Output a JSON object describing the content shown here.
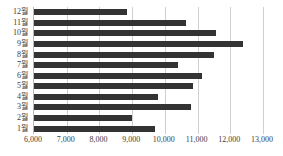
{
  "chart_data": {
    "type": "bar",
    "orientation": "horizontal",
    "title": "",
    "subtitle": "",
    "xlabel": "",
    "ylabel": "",
    "categories": [
      "1월",
      "2월",
      "3월",
      "4월",
      "5월",
      "6월",
      "7월",
      "8월",
      "9월",
      "10월",
      "11월",
      "12월"
    ],
    "values": [
      9700,
      9000,
      10800,
      9800,
      10850,
      11150,
      10400,
      11500,
      12400,
      11550,
      10650,
      8850
    ],
    "xlim": [
      6000,
      13000
    ],
    "xticks": [
      6000,
      7000,
      8000,
      9000,
      10000,
      11000,
      12000,
      13000
    ],
    "xtick_labels": [
      "6,000",
      "7,000",
      "8,000",
      "9,000",
      "10,000",
      "11,000",
      "12,000",
      "13,000"
    ],
    "grid": "vertical",
    "legend": "none",
    "bar_color": "#333333",
    "gridline_color": "#cfcfcf",
    "axis_color": "#b8b8b8",
    "background_color": "#ffffff",
    "display_order": "top-to-bottom-descending-month",
    "rows_top_to_bottom": [
      {
        "label": "12월",
        "value": 8850
      },
      {
        "label": "11월",
        "value": 10650
      },
      {
        "label": "10월",
        "value": 11550
      },
      {
        "label": "9월",
        "value": 12400
      },
      {
        "label": "8월",
        "value": 11500
      },
      {
        "label": "7월",
        "value": 10400
      },
      {
        "label": "6월",
        "value": 11150
      },
      {
        "label": "5월",
        "value": 10850
      },
      {
        "label": "4월",
        "value": 9800
      },
      {
        "label": "3월",
        "value": 10800
      },
      {
        "label": "2월",
        "value": 9000
      },
      {
        "label": "1월",
        "value": 9700
      }
    ]
  }
}
